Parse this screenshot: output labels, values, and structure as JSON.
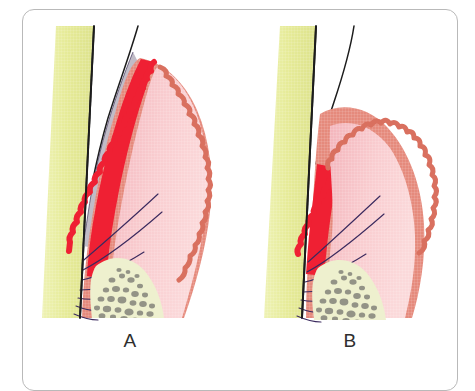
{
  "figure": {
    "type": "anatomical-illustration",
    "panels": [
      {
        "id": "A",
        "label": "A",
        "description": "Cross-section of gingiva and tooth showing deep inflamed sulcus with extensive bright red inflammatory infiltrate extending apically along the root, plaque-filled pocket shown as grey-lavender band, gingival margin positioned coronally.",
        "regions": [
          {
            "name": "tooth-root",
            "label": "Tooth root",
            "color": "#e8ec9c"
          },
          {
            "name": "tooth-crown",
            "label": "Tooth crown enamel",
            "color": "#ffffff"
          },
          {
            "name": "pocket-plaque",
            "label": "Periodontal pocket / plaque",
            "color": "#b8b3bf"
          },
          {
            "name": "inflamed-tissue",
            "label": "Inflamed tissue",
            "color": "#ef2033"
          },
          {
            "name": "gingival-epithelium",
            "label": "Gingival epithelium",
            "color": "#e58a7c"
          },
          {
            "name": "connective-tissue",
            "label": "Connective tissue",
            "color": "#f8c7ca"
          },
          {
            "name": "inner-lamina",
            "label": "Inner lamina propria",
            "color": "#f4b7bc"
          },
          {
            "name": "alveolar-bone",
            "label": "Alveolar bone",
            "color": "#eef0cf"
          },
          {
            "name": "trabeculae",
            "label": "Bone trabeculae",
            "color": "#8b8b80"
          },
          {
            "name": "gingival-fibers",
            "label": "Gingival / periodontal fibers",
            "color": "#3b2a5e"
          }
        ]
      },
      {
        "id": "B",
        "label": "B",
        "description": "Cross-section of gingiva and tooth showing a shallower sulcus with a smaller, more localized bright red inflammatory zone near the gingival margin, gingival margin positioned more apically, no visible plaque band.",
        "regions": [
          {
            "name": "tooth-root",
            "label": "Tooth root",
            "color": "#e8ec9c"
          },
          {
            "name": "tooth-crown",
            "label": "Tooth crown enamel",
            "color": "#ffffff"
          },
          {
            "name": "inflamed-tissue",
            "label": "Inflamed tissue",
            "color": "#ef2033"
          },
          {
            "name": "gingival-epithelium",
            "label": "Gingival epithelium",
            "color": "#e58a7c"
          },
          {
            "name": "connective-tissue",
            "label": "Connective tissue",
            "color": "#f8c7ca"
          },
          {
            "name": "inner-lamina",
            "label": "Inner lamina propria",
            "color": "#f4b7bc"
          },
          {
            "name": "alveolar-bone",
            "label": "Alveolar bone",
            "color": "#eef0cf"
          },
          {
            "name": "trabeculae",
            "label": "Bone trabeculae",
            "color": "#8b8b80"
          },
          {
            "name": "gingival-fibers",
            "label": "Gingival / periodontal fibers",
            "color": "#3b2a5e"
          }
        ]
      }
    ],
    "frame": {
      "border_color": "#b9b9b9",
      "background": "#ffffff"
    },
    "palette": {
      "root_yellow": "#e8ec9c",
      "root_yellow_dark": "#d8dd85",
      "enamel_white": "#ffffff",
      "outline_black": "#1a1a1a",
      "plaque_grey": "#b8b3bf",
      "inflam_red": "#ef2033",
      "epithelium_salmon": "#e58a7c",
      "epithelium_salmon_dark": "#d9705f",
      "connective_pink": "#f8c7ca",
      "lamina_pink": "#f4b7bc",
      "bone_cream": "#eef0cf",
      "trabecula_grey": "#8b8b80",
      "fiber_purple": "#3b2a5e",
      "label_text": "#2e2e2e"
    }
  }
}
